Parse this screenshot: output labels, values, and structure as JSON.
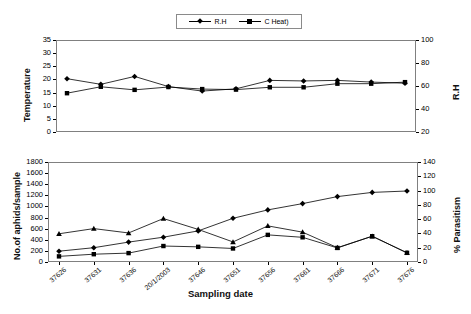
{
  "figure": {
    "background": "#ffffff",
    "line_color": "#000000"
  },
  "top_chart": {
    "legend": [
      {
        "label": "R.H",
        "marker": "diamond"
      },
      {
        "label": "C Heat)",
        "marker": "square"
      }
    ],
    "y_left_title": "Temperature",
    "y_right_title": "R.H",
    "y_left_ticks": [
      "35",
      "30",
      "25",
      "20",
      "15",
      "10",
      "5",
      "0"
    ],
    "y_right_ticks": [
      "100",
      "80",
      "60",
      "40",
      "20"
    ]
  },
  "bottom_chart": {
    "legend": [
      {
        "label": "No.of Examined aphid",
        "marker": "triangle"
      },
      {
        "label": "No .of Mummified aphids",
        "marker": "square"
      },
      {
        "label": "%Parasitism",
        "marker": "diamond"
      }
    ],
    "y_left_title": "No.of aphids/sample",
    "y_right_title": "% Parasitism",
    "x_title": "Sampling date",
    "y_left_ticks": [
      "1800",
      "1600",
      "1400",
      "1200",
      "1000",
      "800",
      "600",
      "400",
      "200",
      "0"
    ],
    "y_right_ticks": [
      "140",
      "120",
      "100",
      "80",
      "60",
      "40",
      "20",
      "0"
    ]
  },
  "chart_data": [
    {
      "type": "line",
      "title": "",
      "xlabel": "",
      "ylabel": "Temperature",
      "y2label": "R.H",
      "ylim": [
        0,
        35
      ],
      "y2lim": [
        20,
        100
      ],
      "grid": false,
      "legend_position": "top-center",
      "categories": [
        "37626",
        "37631",
        "37636",
        "20/1/2003",
        "37646",
        "37651",
        "37656",
        "37661",
        "37666",
        "37671",
        "37676"
      ],
      "series": [
        {
          "name": "R.H",
          "axis": "right",
          "marker": "diamond",
          "values": [
            66.5,
            61.5,
            68.5,
            59.5,
            55.5,
            57.5,
            65.0,
            64.5,
            65.0,
            63.5,
            62.5
          ]
        },
        {
          "name": "C Heat)",
          "axis": "left",
          "marker": "square",
          "values": [
            14.7,
            17.2,
            16.0,
            17.1,
            16.3,
            16.1,
            17.0,
            17.0,
            18.4,
            18.4,
            19.0
          ]
        }
      ]
    },
    {
      "type": "line",
      "title": "",
      "xlabel": "Sampling date",
      "ylabel": "No.of aphids/sample",
      "y2label": "% Parasitism",
      "ylim": [
        0,
        1800
      ],
      "y2lim": [
        0,
        140
      ],
      "grid": false,
      "legend_position": "top-center",
      "categories": [
        "37626",
        "37631",
        "37636",
        "20/1/2003",
        "37646",
        "37651",
        "37656",
        "37661",
        "37666",
        "37671",
        "37676"
      ],
      "series": [
        {
          "name": "No.of Examined aphid",
          "axis": "left",
          "marker": "triangle",
          "values": [
            500,
            595,
            515,
            780,
            580,
            350,
            645,
            530,
            245,
            455,
            150
          ]
        },
        {
          "name": "No .of Mummified aphids",
          "axis": "left",
          "marker": "square",
          "values": [
            85,
            125,
            145,
            275,
            260,
            230,
            480,
            435,
            240,
            455,
            150
          ]
        },
        {
          "name": "%Parasitism",
          "axis": "right",
          "marker": "diamond",
          "values": [
            14,
            19,
            27,
            34,
            43,
            61,
            73,
            82,
            92,
            98,
            100
          ]
        }
      ]
    }
  ]
}
